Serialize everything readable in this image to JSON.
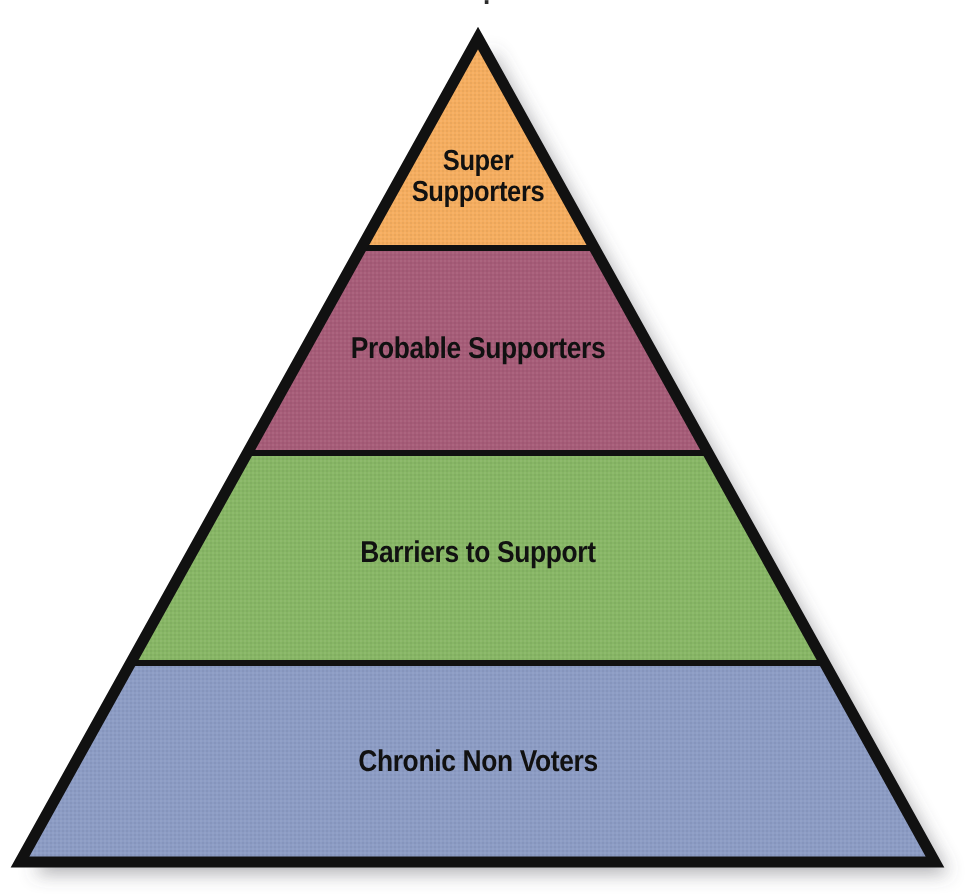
{
  "diagram": {
    "type": "pyramid",
    "title_clipped": ".",
    "background_color": "#ffffff",
    "outline_color": "#111111",
    "outline_width_px": 11,
    "shadow_color": "rgba(90,90,95,0.45)",
    "apex": {
      "x": 478,
      "y": 38
    },
    "base_left": {
      "x": 20,
      "y": 862
    },
    "base_right": {
      "x": 935,
      "y": 862
    },
    "bands": [
      {
        "id": "super-supporters",
        "label": "Super\nSupporters",
        "label_plain": "Super Supporters",
        "fill_color": "#f5ad5f",
        "text_color": "#111111",
        "top_y": 38,
        "bottom_y": 248,
        "level": 1,
        "lines": 2
      },
      {
        "id": "probable-supporters",
        "label": "Probable Supporters",
        "label_plain": "Probable Supporters",
        "fill_color": "#a65c78",
        "text_color": "#111111",
        "top_y": 248,
        "bottom_y": 453,
        "level": 2,
        "lines": 1
      },
      {
        "id": "barriers-to-support",
        "label": "Barriers to Support",
        "label_plain": "Barriers to Support",
        "fill_color": "#87b665",
        "text_color": "#111111",
        "top_y": 453,
        "bottom_y": 663,
        "level": 3,
        "lines": 1
      },
      {
        "id": "chronic-non-voters",
        "label": "Chronic Non Voters",
        "label_plain": "Chronic Non Voters",
        "fill_color": "#8c9cc4",
        "text_color": "#111111",
        "top_y": 663,
        "bottom_y": 862,
        "level": 4,
        "lines": 1
      }
    ],
    "divider_color": "#111111",
    "divider_width_px": 6
  },
  "chart_data": {
    "type": "pie",
    "title": "",
    "categories": [
      "Super Supporters",
      "Probable Supporters",
      "Barriers to Support",
      "Chronic Non Voters"
    ],
    "values": [
      210,
      205,
      210,
      199
    ],
    "value_unit": "band height (px)",
    "colors": [
      "#f5ad5f",
      "#a65c78",
      "#87b665",
      "#8c9cc4"
    ],
    "xlabel": "",
    "ylabel": "",
    "legend": "none",
    "grid": false
  }
}
